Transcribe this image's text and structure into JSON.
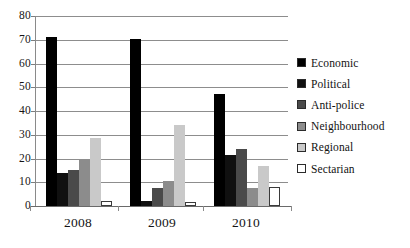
{
  "chart_data": {
    "type": "bar",
    "title": "",
    "subtitle": "",
    "xlabel": "",
    "ylabel": "",
    "ylim": [
      0,
      80
    ],
    "ytick_step": 10,
    "yticks": [
      "80",
      "70",
      "60",
      "50",
      "40",
      "30",
      "20",
      "10",
      "0"
    ],
    "grid": true,
    "legend_position": "right",
    "categories": [
      "2008",
      "2009",
      "2010"
    ],
    "series": [
      {
        "name": "Economic",
        "color": "#000000",
        "values": [
          71,
          70.5,
          47
        ]
      },
      {
        "name": "Political",
        "color": "#101010",
        "values": [
          14,
          2,
          21.5
        ]
      },
      {
        "name": "Anti-police",
        "color": "#4a4a4a",
        "values": [
          15,
          7.5,
          24
        ]
      },
      {
        "name": "Neighbourhood",
        "color": "#8c8c8c",
        "values": [
          19.5,
          10.5,
          7.5
        ]
      },
      {
        "name": "Regional",
        "color": "#c9c9c9",
        "values": [
          28.5,
          34,
          17
        ]
      },
      {
        "name": "Sectarian",
        "color": "#ffffff",
        "values": [
          2,
          1.5,
          8
        ]
      }
    ]
  },
  "legend": {
    "items": [
      {
        "label": "Economic"
      },
      {
        "label": "Political"
      },
      {
        "label": "Anti-police"
      },
      {
        "label": "Neighbourhood"
      },
      {
        "label": "Regional"
      },
      {
        "label": "Sectarian"
      }
    ]
  },
  "axes": {
    "y_tick_labels": [
      "80",
      "70",
      "60",
      "50",
      "40",
      "30",
      "20",
      "10",
      "0"
    ],
    "x_tick_labels": [
      "2008",
      "2009",
      "2010"
    ]
  }
}
